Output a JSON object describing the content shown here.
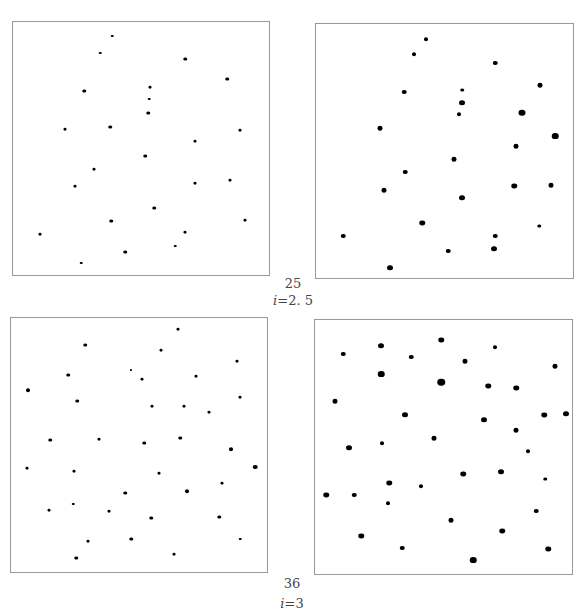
{
  "figure": {
    "groups": [
      {
        "count_label": "25",
        "param_label": "i=2.5",
        "param_symbol": "i",
        "param_value": "=2. 5"
      },
      {
        "count_label": "36",
        "param_label": "i=3",
        "param_symbol": "i",
        "param_value": "=3"
      }
    ]
  },
  "chart_data": [
    {
      "type": "scatter",
      "title": "25 points, i=2.5 (left panel, small dots)",
      "xlim": [
        0,
        258
      ],
      "ylim": [
        0,
        255
      ],
      "points": [
        [
          99,
          14
        ],
        [
          87,
          31
        ],
        [
          172,
          37
        ],
        [
          214,
          57
        ],
        [
          71,
          69
        ],
        [
          137,
          65
        ],
        [
          136,
          77
        ],
        [
          135,
          91
        ],
        [
          52,
          107
        ],
        [
          97,
          105
        ],
        [
          182,
          119
        ],
        [
          227,
          108
        ],
        [
          132,
          134
        ],
        [
          81,
          147
        ],
        [
          62,
          164
        ],
        [
          182,
          161
        ],
        [
          217,
          158
        ],
        [
          141,
          186
        ],
        [
          98,
          199
        ],
        [
          27,
          212
        ],
        [
          172,
          210
        ],
        [
          162,
          224
        ],
        [
          112,
          230
        ],
        [
          68,
          241
        ],
        [
          232,
          198
        ]
      ],
      "dot_sizes": [
        2.5,
        2.5,
        3.5,
        3.5,
        3.5,
        3,
        2.5,
        3.5,
        3,
        3.5,
        3,
        3,
        3.5,
        3,
        3,
        3,
        3,
        3.5,
        3.5,
        3,
        3,
        2.5,
        3.5,
        2.5,
        3
      ]
    },
    {
      "type": "scatter",
      "title": "25 points, i=2.5 (right panel, large dots)",
      "xlim": [
        0,
        259
      ],
      "ylim": [
        0,
        256
      ],
      "points": [
        [
          110,
          15
        ],
        [
          98,
          30
        ],
        [
          179,
          39
        ],
        [
          224,
          61
        ],
        [
          88,
          68
        ],
        [
          146,
          66
        ],
        [
          146,
          79
        ],
        [
          143,
          90
        ],
        [
          206,
          89
        ],
        [
          64,
          104
        ],
        [
          239,
          112
        ],
        [
          200,
          122
        ],
        [
          138,
          135
        ],
        [
          89,
          148
        ],
        [
          68,
          166
        ],
        [
          198,
          162
        ],
        [
          235,
          161
        ],
        [
          146,
          174
        ],
        [
          106,
          199
        ],
        [
          27,
          212
        ],
        [
          179,
          212
        ],
        [
          132,
          227
        ],
        [
          178,
          225
        ],
        [
          74,
          244
        ],
        [
          223,
          202
        ]
      ],
      "dot_sizes": [
        4,
        4,
        4.5,
        5,
        4.5,
        3.5,
        6,
        4,
        7,
        5,
        6.5,
        5,
        5,
        4.5,
        5,
        5.5,
        5,
        6,
        5.5,
        4.5,
        4.5,
        4.5,
        6,
        6,
        3.5
      ]
    },
    {
      "type": "scatter",
      "title": "36 points, i=3 (left panel, small dots)",
      "xlim": [
        0,
        258
      ],
      "ylim": [
        0,
        256
      ],
      "points": [
        [
          167,
          11
        ],
        [
          74,
          27
        ],
        [
          150,
          32
        ],
        [
          226,
          43
        ],
        [
          57,
          57
        ],
        [
          120,
          52
        ],
        [
          131,
          61
        ],
        [
          185,
          58
        ],
        [
          17,
          72
        ],
        [
          66,
          83
        ],
        [
          141,
          88
        ],
        [
          173,
          88
        ],
        [
          198,
          94
        ],
        [
          229,
          79
        ],
        [
          39,
          122
        ],
        [
          88,
          121
        ],
        [
          133,
          125
        ],
        [
          169,
          120
        ],
        [
          220,
          131
        ],
        [
          16,
          150
        ],
        [
          63,
          153
        ],
        [
          148,
          155
        ],
        [
          244,
          149
        ],
        [
          114,
          175
        ],
        [
          176,
          173
        ],
        [
          211,
          165
        ],
        [
          38,
          192
        ],
        [
          62,
          186
        ],
        [
          98,
          193
        ],
        [
          140,
          200
        ],
        [
          208,
          199
        ],
        [
          77,
          223
        ],
        [
          120,
          221
        ],
        [
          229,
          221
        ],
        [
          65,
          240
        ],
        [
          163,
          236
        ]
      ],
      "dot_sizes": [
        3,
        3.5,
        3,
        3,
        3.5,
        2,
        3,
        3,
        4,
        3.5,
        3,
        3,
        3,
        3,
        3.5,
        3,
        3.5,
        3.5,
        4,
        3,
        3,
        3,
        4.5,
        3.5,
        4,
        3,
        3,
        2.5,
        3,
        3.5,
        3.5,
        3,
        3.5,
        2.5,
        3.5,
        3
      ]
    },
    {
      "type": "scatter",
      "title": "36 points, i=3 (right panel, large dots)",
      "xlim": [
        0,
        259
      ],
      "ylim": [
        0,
        256
      ],
      "points": [
        [
          126,
          20
        ],
        [
          66,
          26
        ],
        [
          180,
          27
        ],
        [
          28,
          34
        ],
        [
          96,
          37
        ],
        [
          150,
          41
        ],
        [
          240,
          46
        ],
        [
          66,
          54
        ],
        [
          126,
          62
        ],
        [
          173,
          66
        ],
        [
          201,
          68
        ],
        [
          20,
          81
        ],
        [
          90,
          95
        ],
        [
          169,
          100
        ],
        [
          229,
          95
        ],
        [
          251,
          94
        ],
        [
          119,
          118
        ],
        [
          201,
          110
        ],
        [
          34,
          128
        ],
        [
          67,
          123
        ],
        [
          213,
          131
        ],
        [
          148,
          154
        ],
        [
          186,
          152
        ],
        [
          230,
          159
        ],
        [
          11,
          175
        ],
        [
          39,
          175
        ],
        [
          74,
          163
        ],
        [
          106,
          166
        ],
        [
          73,
          183
        ],
        [
          136,
          200
        ],
        [
          221,
          191
        ],
        [
          46,
          216
        ],
        [
          187,
          211
        ],
        [
          87,
          228
        ],
        [
          158,
          240
        ],
        [
          233,
          229
        ]
      ],
      "dot_sizes": [
        5.5,
        6,
        4,
        4.5,
        4.5,
        5,
        5,
        6.5,
        7.5,
        5.5,
        5.5,
        5,
        6,
        6,
        5.5,
        6,
        5,
        5,
        6,
        4,
        4,
        5.5,
        6,
        3.5,
        5.5,
        4.5,
        5.5,
        4,
        4,
        5,
        4.5,
        5.5,
        5.5,
        4.5,
        6.5,
        5.5
      ]
    }
  ]
}
